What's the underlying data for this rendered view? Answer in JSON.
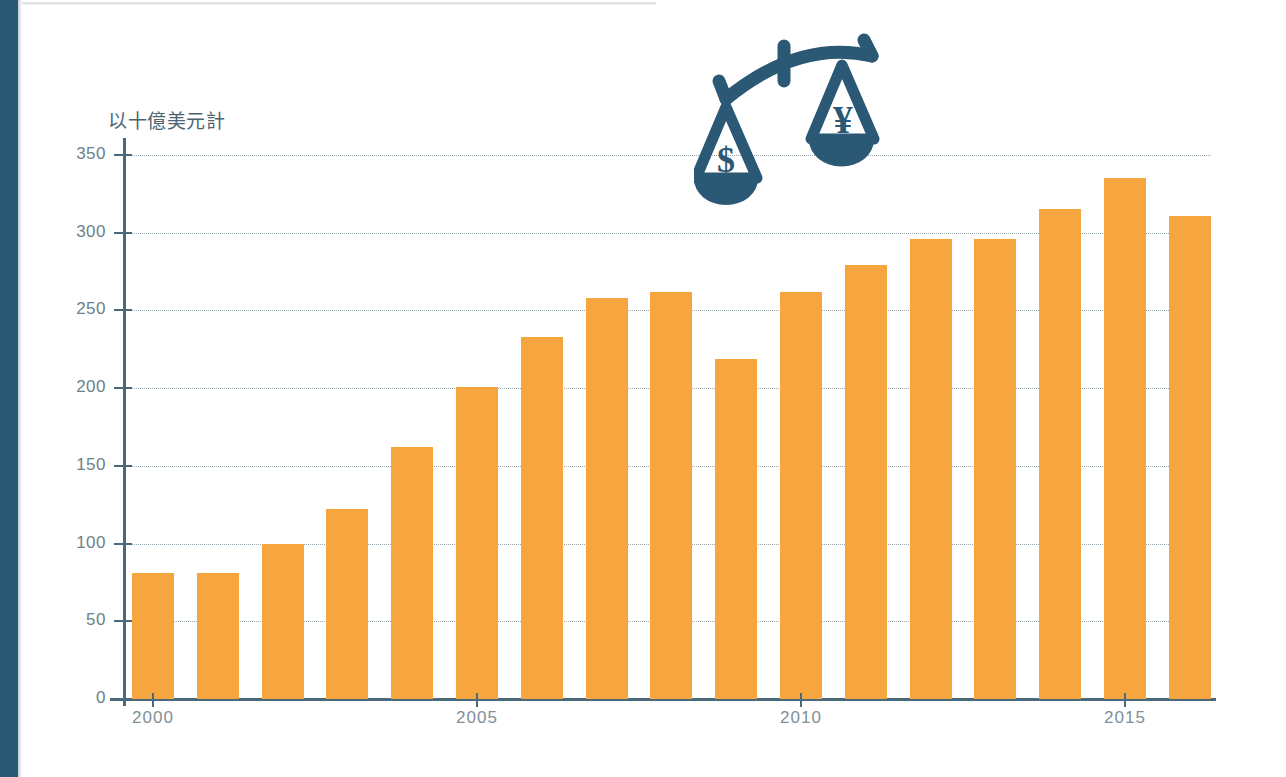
{
  "page": {
    "background_color": "#ffffff",
    "spine_color": "#2b5874"
  },
  "chart_data": {
    "type": "bar",
    "title": "",
    "subtitle": "",
    "xlabel": "",
    "ylabel": "以十億美元計",
    "ylim": [
      0,
      350
    ],
    "y_ticks": [
      0,
      50,
      100,
      150,
      200,
      250,
      300,
      350
    ],
    "y_tick_labels": [
      "0",
      "50",
      "100",
      "150",
      "200",
      "250",
      "300",
      "350"
    ],
    "grid": true,
    "legend": null,
    "bar_color": "#f7a53e",
    "axis_color": "#4a6a7b",
    "categories": [
      "2000",
      "2001",
      "2002",
      "2003",
      "2004",
      "2005",
      "2006",
      "2007",
      "2008",
      "2009",
      "2010",
      "2011",
      "2012",
      "2013",
      "2014",
      "2015",
      "2016"
    ],
    "x_tick_labels": [
      "2000",
      "2005",
      "2010",
      "2015"
    ],
    "x_tick_categories": [
      "2000",
      "2005",
      "2010",
      "2015"
    ],
    "values": [
      81,
      81,
      100,
      122,
      162,
      201,
      233,
      258,
      262,
      219,
      262,
      279,
      296,
      296,
      315,
      335,
      311
    ],
    "series": [
      {
        "name": "以十億美元計",
        "values": [
          81,
          81,
          100,
          122,
          162,
          201,
          233,
          258,
          262,
          219,
          262,
          279,
          296,
          296,
          315,
          335,
          311
        ]
      }
    ],
    "annotations": []
  },
  "icons": {
    "scales": {
      "name": "balance-scales-icon",
      "color": "#2b5874",
      "left_pan_symbol": "$",
      "right_pan_symbol": "¥"
    }
  }
}
